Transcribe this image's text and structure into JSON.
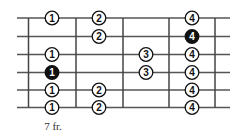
{
  "fret_label": "7 fr.",
  "colors": {
    "line": "#444444",
    "string": "#555555",
    "dot_fill": "#ffffff",
    "root_fill": "#111111",
    "text": "#111111"
  },
  "layout": {
    "string_y": [
      18,
      36.5,
      54.5,
      72.5,
      90,
      107.5
    ],
    "fret_x": [
      28.5,
      76,
      123,
      169,
      215
    ],
    "string_x_start": 17,
    "string_x_end": 230,
    "fret_center_x": [
      52,
      99,
      146,
      192
    ]
  },
  "notes": [
    {
      "string": 0,
      "fret": 0,
      "finger": "1",
      "root": false
    },
    {
      "string": 0,
      "fret": 1,
      "finger": "2",
      "root": false
    },
    {
      "string": 0,
      "fret": 3,
      "finger": "4",
      "root": false
    },
    {
      "string": 1,
      "fret": 1,
      "finger": "2",
      "root": false
    },
    {
      "string": 1,
      "fret": 3,
      "finger": "4",
      "root": true
    },
    {
      "string": 2,
      "fret": 0,
      "finger": "1",
      "root": false
    },
    {
      "string": 2,
      "fret": 2,
      "finger": "3",
      "root": false
    },
    {
      "string": 2,
      "fret": 3,
      "finger": "4",
      "root": false
    },
    {
      "string": 3,
      "fret": 0,
      "finger": "1",
      "root": true
    },
    {
      "string": 3,
      "fret": 2,
      "finger": "3",
      "root": false
    },
    {
      "string": 3,
      "fret": 3,
      "finger": "4",
      "root": false
    },
    {
      "string": 4,
      "fret": 0,
      "finger": "1",
      "root": false
    },
    {
      "string": 4,
      "fret": 1,
      "finger": "2",
      "root": false
    },
    {
      "string": 4,
      "fret": 3,
      "finger": "4",
      "root": false
    },
    {
      "string": 5,
      "fret": 0,
      "finger": "1",
      "root": false
    },
    {
      "string": 5,
      "fret": 1,
      "finger": "2",
      "root": false
    },
    {
      "string": 5,
      "fret": 3,
      "finger": "4",
      "root": false
    }
  ]
}
